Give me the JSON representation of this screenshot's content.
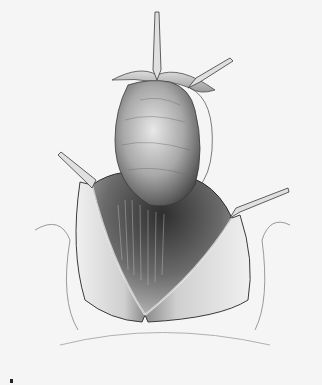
{
  "image": {
    "kind": "surgical-illustration",
    "style": "grayscale pencil drawing",
    "subject": "open surgical incision with retracted tissue flaps and a raised rounded organ mass held by instruments",
    "background_color": "#f5f5f5",
    "ink_color": "#2a2a2a"
  },
  "elements": {
    "retractors": 4,
    "corner_mark": "▪"
  }
}
